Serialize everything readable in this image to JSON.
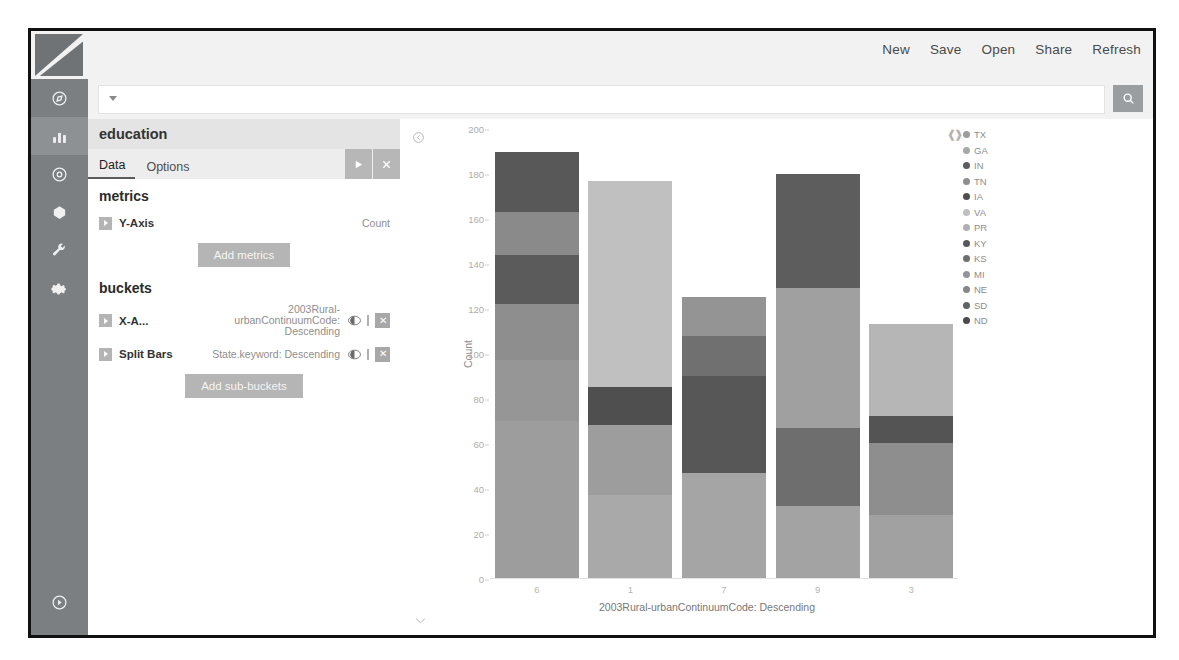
{
  "app": {
    "logo_name": "kibana-logo"
  },
  "globalnav": {
    "items": [
      {
        "name": "discover",
        "icon": "compass-icon"
      },
      {
        "name": "visualize",
        "icon": "bar-chart-icon",
        "active": true
      },
      {
        "name": "dashboard",
        "icon": "dashboard-icon"
      },
      {
        "name": "timelion",
        "icon": "timelion-icon"
      },
      {
        "name": "dev-tools",
        "icon": "wrench-icon"
      },
      {
        "name": "management",
        "icon": "gear-icon"
      }
    ],
    "collapse": {
      "name": "collapse-nav",
      "icon": "chevron-right-circle-icon"
    }
  },
  "topnav": {
    "items": [
      "New",
      "Save",
      "Open",
      "Share",
      "Refresh"
    ]
  },
  "query": {
    "value": "",
    "placeholder": "",
    "search_icon": "search-icon",
    "caret_icon": "caret-down-icon"
  },
  "editor": {
    "title": "education",
    "tabs": [
      {
        "label": "Data",
        "active": true
      },
      {
        "label": "Options",
        "active": false
      }
    ],
    "actions": [
      {
        "name": "apply-changes-button",
        "icon": "play-icon"
      },
      {
        "name": "discard-changes-button",
        "icon": "close-icon"
      }
    ],
    "metrics": {
      "heading": "metrics",
      "rows": [
        {
          "name": "Y-Axis",
          "value": "Count"
        }
      ],
      "add_label": "Add metrics"
    },
    "buckets": {
      "heading": "buckets",
      "rows": [
        {
          "name": "X-A...",
          "value": "2003Rural-urbanContinuumCode: Descending"
        },
        {
          "name": "Split Bars",
          "value": "State.keyword: Descending"
        }
      ],
      "add_label": "Add sub-buckets"
    }
  },
  "chart_data": {
    "type": "bar",
    "stacked": true,
    "title": "",
    "xlabel": "2003Rural-urbanContinuumCode: Descending",
    "ylabel": "Count",
    "categories": [
      "6",
      "1",
      "7",
      "9",
      "3"
    ],
    "yticks": [
      0,
      20,
      40,
      60,
      80,
      100,
      120,
      140,
      160,
      180,
      200
    ],
    "ylim": [
      0,
      200
    ],
    "grid": false,
    "legend_position": "right",
    "series": [
      {
        "name": "TX",
        "color": "#8f8f8f",
        "values": [
          70,
          37,
          47,
          32,
          28
        ]
      },
      {
        "name": "GA",
        "color": "#a3a3a3",
        "values": [
          27,
          31,
          0,
          0,
          0
        ]
      },
      {
        "name": "IN",
        "color": "#5e5e5e",
        "values": [
          25,
          0,
          43,
          35,
          32
        ]
      },
      {
        "name": "TN",
        "color": "#9b9b9b",
        "values": [
          22,
          0,
          0,
          62,
          0
        ]
      },
      {
        "name": "IA",
        "color": "#4f4f4f",
        "values": [
          19,
          17,
          0,
          0,
          0
        ]
      },
      {
        "name": "VA",
        "color": "#c2c2c2",
        "values": [
          0,
          92,
          0,
          0,
          41
        ]
      },
      {
        "name": "PR",
        "color": "#b1b1b1",
        "values": [
          0,
          0,
          0,
          0,
          12
        ]
      },
      {
        "name": "KY",
        "color": "#5a5a5a",
        "values": [
          0,
          0,
          0,
          0,
          0
        ]
      },
      {
        "name": "KS",
        "color": "#707070",
        "values": [
          0,
          0,
          18,
          0,
          0
        ]
      },
      {
        "name": "MI",
        "color": "#989898",
        "values": [
          0,
          0,
          17,
          0,
          0
        ]
      },
      {
        "name": "NE",
        "color": "#868686",
        "values": [
          0,
          0,
          0,
          0,
          0
        ]
      },
      {
        "name": "SD",
        "color": "#636363",
        "values": [
          0,
          0,
          0,
          51,
          0
        ]
      },
      {
        "name": "ND",
        "color": "#4a4a4a",
        "values": [
          27,
          0,
          0,
          0,
          0
        ]
      }
    ],
    "bar_segments": [
      {
        "category": "6",
        "total": 190,
        "segments": [
          {
            "label": "TX",
            "value": 70,
            "color": "#9d9d9d"
          },
          {
            "label": "GA",
            "value": 27,
            "color": "#969696"
          },
          {
            "label": "IN",
            "value": 25,
            "color": "#8e8e8e"
          },
          {
            "label": "TN",
            "value": 22,
            "color": "#5b5b5b"
          },
          {
            "label": "IA",
            "value": 19,
            "color": "#8a8a8a"
          },
          {
            "label": "ND",
            "value": 27,
            "color": "#585858"
          }
        ]
      },
      {
        "category": "1",
        "total": 177,
        "segments": [
          {
            "label": "TX",
            "value": 37,
            "color": "#a9a9a9"
          },
          {
            "label": "GA",
            "value": 31,
            "color": "#9d9d9d"
          },
          {
            "label": "IA",
            "value": 17,
            "color": "#4f4f4f"
          },
          {
            "label": "VA",
            "value": 92,
            "color": "#c0c0c0"
          }
        ]
      },
      {
        "category": "7",
        "total": 125,
        "segments": [
          {
            "label": "TX",
            "value": 47,
            "color": "#a5a5a5"
          },
          {
            "label": "IN",
            "value": 43,
            "color": "#575757"
          },
          {
            "label": "KS",
            "value": 18,
            "color": "#707070"
          },
          {
            "label": "MI",
            "value": 17,
            "color": "#949494"
          }
        ]
      },
      {
        "category": "9",
        "total": 180,
        "segments": [
          {
            "label": "TX",
            "value": 32,
            "color": "#a3a3a3"
          },
          {
            "label": "IN",
            "value": 35,
            "color": "#6e6e6e"
          },
          {
            "label": "TN",
            "value": 62,
            "color": "#a0a0a0"
          },
          {
            "label": "SD",
            "value": 51,
            "color": "#5d5d5d"
          }
        ]
      },
      {
        "category": "3",
        "total": 113,
        "segments": [
          {
            "label": "TX",
            "value": 28,
            "color": "#a1a1a1"
          },
          {
            "label": "IN",
            "value": 32,
            "color": "#8e8e8e"
          },
          {
            "label": "PR",
            "value": 12,
            "color": "#545454"
          },
          {
            "label": "VA",
            "value": 41,
            "color": "#b6b6b6"
          }
        ]
      }
    ],
    "legend": [
      "TX",
      "GA",
      "IN",
      "TN",
      "IA",
      "VA",
      "PR",
      "KY",
      "KS",
      "MI",
      "NE",
      "SD",
      "ND"
    ],
    "legend_colors": [
      "#9d9d9d",
      "#a8a8a8",
      "#5c5c5c",
      "#8e8e8e",
      "#4f4f4f",
      "#c0c0c0",
      "#b0b0b0",
      "#585858",
      "#6e6e6e",
      "#949494",
      "#868686",
      "#626262",
      "#4a4a4a"
    ],
    "legend_toggle_icon": "collapse-legend-icon"
  }
}
